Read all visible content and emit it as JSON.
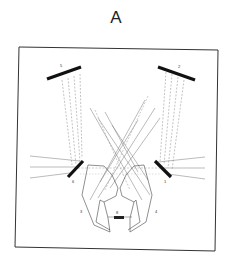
{
  "figure": {
    "panel_label": "A",
    "labels": {
      "top_left_mirror": "5",
      "top_right_mirror": "2",
      "left_small_mirror": "6",
      "right_small_mirror": "1",
      "left_prism": "3",
      "right_prism": "4",
      "center_element": "8"
    },
    "colors": {
      "frame": "#333333",
      "mirror": "#111111",
      "ray": "#777777",
      "background": "#ffffff"
    }
  }
}
